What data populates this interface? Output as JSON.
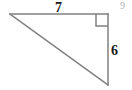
{
  "figure": {
    "type": "right-triangle-diagram",
    "canvas": {
      "width": 132,
      "height": 90,
      "background": "#ffffff"
    },
    "stroke_color": "#808080",
    "stroke_width": 1.5,
    "vertices": {
      "left": {
        "x": 10,
        "y": 14
      },
      "top_right": {
        "x": 108,
        "y": 14
      },
      "bottom_right": {
        "x": 108,
        "y": 85
      }
    },
    "right_angle_marker": {
      "at_vertex": "top_right",
      "size": 12,
      "color": "#808080"
    },
    "labels": {
      "top_leg": "7",
      "right_leg": "6",
      "corner_number": "9"
    },
    "label_colors": {
      "measurement": "#1a1a1a",
      "corner_number": "#b5b5b5"
    }
  }
}
